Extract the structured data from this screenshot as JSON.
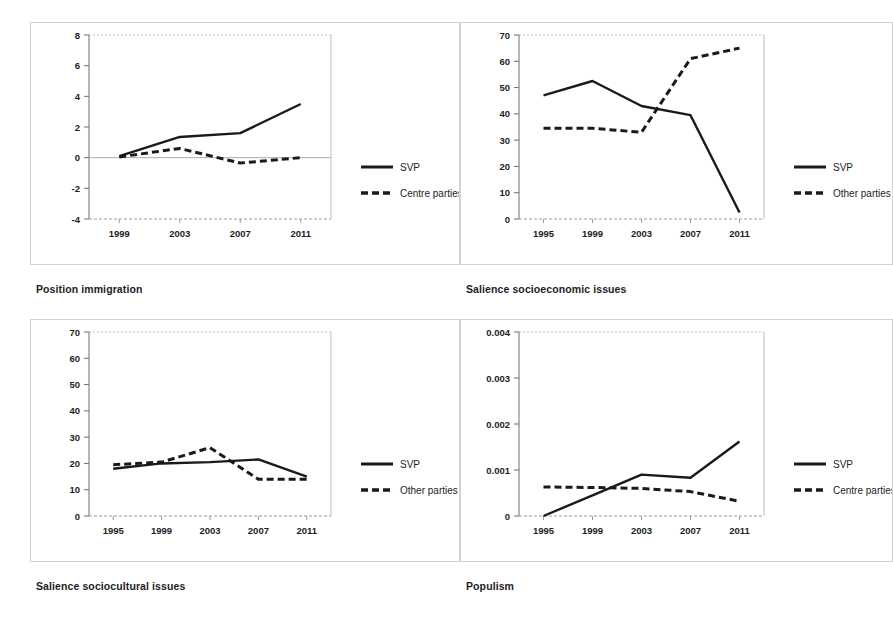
{
  "page": {
    "background": "#ffffff",
    "frame_border_color": "#d2d2d2",
    "line_color": "#1a1a1a"
  },
  "panels": [
    {
      "caption": "Position immigration",
      "legend": {
        "solid": "SVP",
        "dashed": "Centre parties"
      }
    },
    {
      "caption": "Salience socioeconomic issues",
      "legend": {
        "solid": "SVP",
        "dashed": "Other parties"
      }
    },
    {
      "caption": "Salience sociocultural issues",
      "legend": {
        "solid": "SVP",
        "dashed": "Other parties"
      }
    },
    {
      "caption": "Populism",
      "legend": {
        "solid": "SVP",
        "dashed": "Centre parties"
      }
    }
  ],
  "chart_data": [
    {
      "type": "line",
      "title": "Position immigration",
      "xlabel": "",
      "ylabel": "",
      "categories": [
        "1999",
        "2003",
        "2007",
        "2011"
      ],
      "x_ticks": [
        "1999",
        "2003",
        "2007",
        "2011"
      ],
      "y_ticks": [
        "-4",
        "-2",
        "0",
        "2",
        "4",
        "6",
        "8"
      ],
      "ylim": [
        -4,
        8
      ],
      "grid": false,
      "legend_position": "right",
      "series": [
        {
          "name": "SVP",
          "style": "solid",
          "values": [
            0.1,
            1.35,
            1.6,
            3.5
          ]
        },
        {
          "name": "Centre parties",
          "style": "dashed",
          "values": [
            0.05,
            0.6,
            -0.35,
            0.0
          ]
        }
      ]
    },
    {
      "type": "line",
      "title": "Salience socioeconomic issues",
      "xlabel": "",
      "ylabel": "",
      "categories": [
        "1995",
        "1999",
        "2003",
        "2007",
        "2011"
      ],
      "x_ticks": [
        "1995",
        "1999",
        "2003",
        "2007",
        "2011"
      ],
      "y_ticks": [
        "0",
        "10",
        "20",
        "30",
        "40",
        "50",
        "60",
        "70"
      ],
      "ylim": [
        0,
        70
      ],
      "grid": false,
      "legend_position": "right",
      "series": [
        {
          "name": "SVP",
          "style": "solid",
          "values": [
            47,
            52.5,
            43,
            39.5,
            2.5
          ]
        },
        {
          "name": "Other parties",
          "style": "dashed",
          "values": [
            34.5,
            34.5,
            33,
            61,
            65
          ]
        }
      ]
    },
    {
      "type": "line",
      "title": "Salience sociocultural issues",
      "xlabel": "",
      "ylabel": "",
      "categories": [
        "1995",
        "1999",
        "2003",
        "2007",
        "2011"
      ],
      "x_ticks": [
        "1995",
        "1999",
        "2003",
        "2007",
        "2011"
      ],
      "y_ticks": [
        "0",
        "10",
        "20",
        "30",
        "40",
        "50",
        "60",
        "70"
      ],
      "ylim": [
        0,
        70
      ],
      "grid": false,
      "legend_position": "right",
      "series": [
        {
          "name": "SVP",
          "style": "solid",
          "values": [
            18,
            20,
            20.5,
            21.5,
            15
          ]
        },
        {
          "name": "Other parties",
          "style": "dashed",
          "values": [
            19.5,
            20.5,
            26,
            14,
            14
          ]
        }
      ]
    },
    {
      "type": "line",
      "title": "Populism",
      "xlabel": "",
      "ylabel": "",
      "categories": [
        "1995",
        "1999",
        "2003",
        "2007",
        "2011"
      ],
      "x_ticks": [
        "1995",
        "1999",
        "2003",
        "2007",
        "2011"
      ],
      "y_ticks": [
        "0",
        "0.001",
        "0.002",
        "0.003",
        "0.004"
      ],
      "ylim": [
        0,
        0.004
      ],
      "grid": false,
      "legend_position": "right",
      "series": [
        {
          "name": "SVP",
          "style": "solid",
          "values": [
            0.0,
            0.00045,
            0.0009,
            0.00083,
            0.00162
          ]
        },
        {
          "name": "Centre parties",
          "style": "dashed",
          "values": [
            0.00063,
            0.00062,
            0.0006,
            0.00053,
            0.00032
          ]
        }
      ]
    }
  ]
}
